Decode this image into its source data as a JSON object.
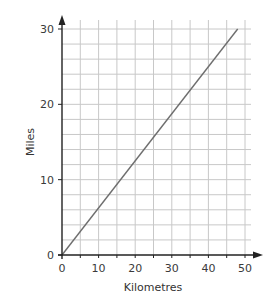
{
  "chart_data": {
    "type": "line",
    "title": "",
    "xlabel": "Kilometres",
    "ylabel": "Miles",
    "xlim": [
      0,
      50
    ],
    "ylim": [
      0,
      30
    ],
    "x_ticks": [
      0,
      10,
      20,
      30,
      40,
      50
    ],
    "y_ticks": [
      0,
      10,
      20,
      30
    ],
    "x_grid_step": 5,
    "y_grid_step": 2,
    "grid": true,
    "legend": null,
    "series": [
      {
        "name": "Kilometres to miles",
        "x": [
          0,
          48
        ],
        "y": [
          0,
          30
        ],
        "color": "#6e6e6e"
      }
    ]
  },
  "colors": {
    "axis": "#222222",
    "grid": "#c8c8c8",
    "line": "#6e6e6e"
  }
}
